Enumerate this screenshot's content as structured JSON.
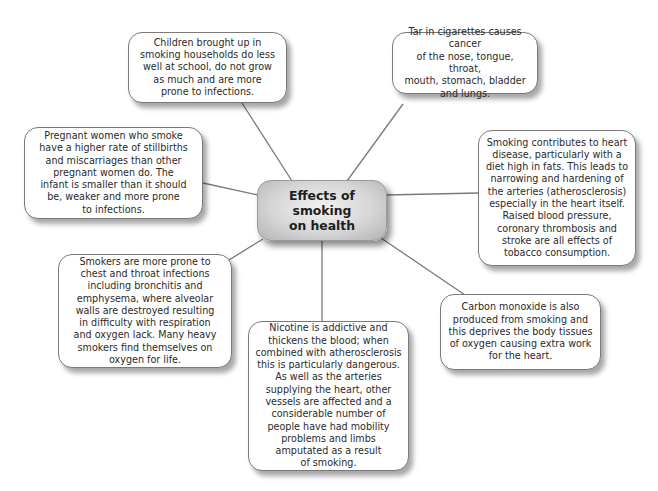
{
  "diagram": {
    "type": "mind-map",
    "central_topic": "Effects of\nsmoking\non health",
    "colors": {
      "background": "#ffffff",
      "connector": "#7a7a7a",
      "box_border": "#7a7a7a",
      "center_fill_light": "#f2f2f2",
      "center_fill_dark": "#b3b3b3",
      "text": "#2a2a2a"
    },
    "nodes": [
      {
        "id": "children",
        "text": "Children brought up in\nsmoking households do less\nwell at school, do not grow\nas much and are more\nprone to infections."
      },
      {
        "id": "tar",
        "text": "Tar in cigarettes causes cancer\nof the nose, tongue, throat,\nmouth, stomach, bladder\nand lungs."
      },
      {
        "id": "pregnant",
        "text": "Pregnant women who smoke\nhave a higher rate of stillbirths\nand miscarriages than other\npregnant women do. The\ninfant is smaller than it should\nbe, weaker and more prone\nto infections."
      },
      {
        "id": "heart",
        "text": "Smoking contributes to heart\ndisease, particularly with a\ndiet high in fats. This leads to\nnarrowing and hardening of\nthe arteries (atherosclerosis)\nespecially in the heart itself.\nRaised blood pressure,\ncoronary thrombosis and\nstroke are all effects of\ntobacco consumption."
      },
      {
        "id": "respiratory",
        "text": "Smokers are more prone to\nchest and throat infections\nincluding bronchitis and\nemphysema, where alveolar\nwalls are destroyed resulting\nin difficulty with respiration\nand oxygen lack. Many heavy\nsmokers find themselves on\noxygen for life."
      },
      {
        "id": "carbon-monoxide",
        "text": "Carbon monoxide is also\nproduced from smoking and\nthis deprives the body tissues\nof oxygen causing extra work\nfor the heart."
      },
      {
        "id": "nicotine",
        "text": "Nicotine is addictive and\nthickens the blood; when\ncombined with atherosclerosis\nthis is particularly dangerous.\nAs well as the arteries\nsupplying the heart, other\nvessels are affected and a\nconsiderable number of\npeople have had mobility\nproblems and limbs\namputated as a result\nof smoking."
      }
    ]
  }
}
